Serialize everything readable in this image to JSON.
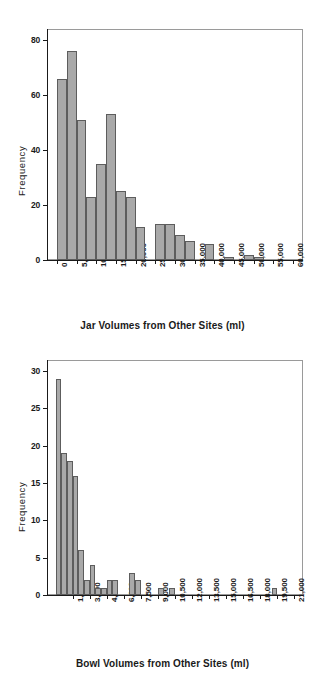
{
  "chart_data": [
    {
      "id": "jar-histogram",
      "type": "bar",
      "title": "",
      "xlabel": "Jar Volumes from Other Sites (ml)",
      "ylabel": "Frequency",
      "xlim": [
        -2500,
        62500
      ],
      "ylim": [
        0,
        84
      ],
      "bin_width": 2500,
      "grid": false,
      "legend": "none",
      "ytick_values": [
        0,
        20,
        40,
        60,
        80
      ],
      "ytick_labels": [
        "0",
        "20",
        "40",
        "60",
        "80"
      ],
      "xtick_values": [
        0,
        5000,
        10000,
        15000,
        20000,
        25000,
        30000,
        35000,
        40000,
        45000,
        50000,
        55000,
        60000
      ],
      "xtick_labels": [
        "0",
        "5,000",
        "10,000",
        "15,000",
        "20,000",
        "25,000",
        "30,000",
        "35,000",
        "40,000",
        "45,000",
        "50,000",
        "55,000",
        "60,000"
      ],
      "bins": [
        {
          "x0": 0,
          "x1": 2500,
          "value": 66
        },
        {
          "x0": 2500,
          "x1": 5000,
          "value": 76
        },
        {
          "x0": 5000,
          "x1": 7500,
          "value": 51
        },
        {
          "x0": 7500,
          "x1": 10000,
          "value": 23
        },
        {
          "x0": 10000,
          "x1": 12500,
          "value": 35
        },
        {
          "x0": 12500,
          "x1": 15000,
          "value": 53
        },
        {
          "x0": 15000,
          "x1": 17500,
          "value": 25
        },
        {
          "x0": 17500,
          "x1": 20000,
          "value": 23
        },
        {
          "x0": 20000,
          "x1": 22500,
          "value": 12
        },
        {
          "x0": 22500,
          "x1": 25000,
          "value": 0
        },
        {
          "x0": 25000,
          "x1": 27500,
          "value": 13
        },
        {
          "x0": 27500,
          "x1": 30000,
          "value": 13
        },
        {
          "x0": 30000,
          "x1": 32500,
          "value": 9
        },
        {
          "x0": 32500,
          "x1": 35000,
          "value": 7
        },
        {
          "x0": 35000,
          "x1": 37500,
          "value": 0
        },
        {
          "x0": 37500,
          "x1": 40000,
          "value": 6
        },
        {
          "x0": 40000,
          "x1": 42500,
          "value": 0
        },
        {
          "x0": 42500,
          "x1": 45000,
          "value": 1
        },
        {
          "x0": 45000,
          "x1": 47500,
          "value": 0
        },
        {
          "x0": 47500,
          "x1": 50000,
          "value": 2
        },
        {
          "x0": 50000,
          "x1": 52500,
          "value": 1
        },
        {
          "x0": 52500,
          "x1": 55000,
          "value": 0
        },
        {
          "x0": 55000,
          "x1": 57500,
          "value": 0
        },
        {
          "x0": 57500,
          "x1": 60000,
          "value": 0
        }
      ]
    },
    {
      "id": "bowl-histogram",
      "type": "bar",
      "title": "",
      "xlabel": "Bowl Volumes from Other Sites (ml)",
      "ylabel": "Frequency",
      "xlim": [
        -750,
        21750
      ],
      "ylim": [
        0,
        31.5
      ],
      "bin_width": 500,
      "grid": false,
      "legend": "none",
      "ytick_values": [
        0,
        5,
        10,
        15,
        20,
        25,
        30
      ],
      "ytick_labels": [
        "0",
        "5",
        "10",
        "15",
        "20",
        "25",
        "30"
      ],
      "xtick_values": [
        1500,
        3000,
        4500,
        6000,
        7500,
        9000,
        10500,
        12000,
        13500,
        15000,
        16500,
        18000,
        19500,
        21000
      ],
      "xtick_labels": [
        "1,500",
        "3,000",
        "4,500",
        "6,000",
        "7,500",
        "9,000",
        "10,500",
        "12,000",
        "13,500",
        "15,000",
        "16,500",
        "18,000",
        "19,500",
        "21,000"
      ],
      "bins": [
        {
          "x0": 0,
          "x1": 500,
          "value": 29
        },
        {
          "x0": 500,
          "x1": 1000,
          "value": 19
        },
        {
          "x0": 1000,
          "x1": 1500,
          "value": 18
        },
        {
          "x0": 1500,
          "x1": 2000,
          "value": 16
        },
        {
          "x0": 2000,
          "x1": 2500,
          "value": 6
        },
        {
          "x0": 2500,
          "x1": 3000,
          "value": 2
        },
        {
          "x0": 3000,
          "x1": 3500,
          "value": 4
        },
        {
          "x0": 3500,
          "x1": 4000,
          "value": 1
        },
        {
          "x0": 4000,
          "x1": 4500,
          "value": 1
        },
        {
          "x0": 4500,
          "x1": 5000,
          "value": 2
        },
        {
          "x0": 5000,
          "x1": 5500,
          "value": 2
        },
        {
          "x0": 5500,
          "x1": 6000,
          "value": 0
        },
        {
          "x0": 6000,
          "x1": 6500,
          "value": 0
        },
        {
          "x0": 6500,
          "x1": 7000,
          "value": 3
        },
        {
          "x0": 7000,
          "x1": 7500,
          "value": 2
        },
        {
          "x0": 7500,
          "x1": 8000,
          "value": 0
        },
        {
          "x0": 8000,
          "x1": 8500,
          "value": 0
        },
        {
          "x0": 8500,
          "x1": 9000,
          "value": 0
        },
        {
          "x0": 9000,
          "x1": 9500,
          "value": 1
        },
        {
          "x0": 9500,
          "x1": 10000,
          "value": 0
        },
        {
          "x0": 10000,
          "x1": 10500,
          "value": 1
        },
        {
          "x0": 19000,
          "x1": 19500,
          "value": 1
        }
      ]
    }
  ],
  "figures": {
    "top": {
      "ylabel": "Frequency",
      "xlabel": "Jar Volumes from Other Sites (ml)"
    },
    "bottom": {
      "ylabel": "Frequency",
      "xlabel": "Bowl Volumes from Other Sites (ml)"
    }
  },
  "colors": {
    "bar_fill": "#a9a9a9",
    "bar_edge": "#5d5d5d",
    "axis": "#1a1a1a",
    "frame": "#9a9a9a",
    "background": "#ffffff"
  }
}
